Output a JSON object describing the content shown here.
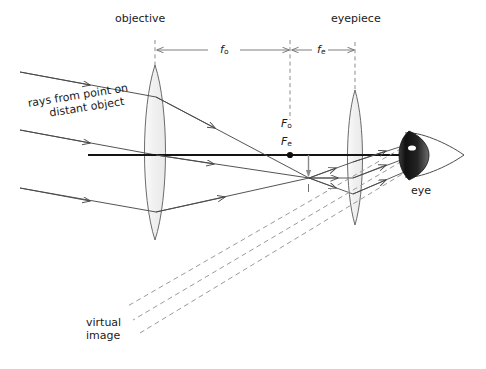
{
  "figure": {
    "background": "#ffffff",
    "ink": "#1a1a1a",
    "ray_color": "#4a4a4a",
    "dash_color": "#8c8c8c",
    "lens_fill": "#f2f2f2",
    "lens_stroke": "#6b6b6b",
    "eye_dark": "#1c1c1c"
  },
  "labels": {
    "objective": "objective",
    "eyepiece": "eyepiece",
    "eye": "eye",
    "rays_line1": "rays from point on",
    "rays_line2": "distant object",
    "virtual_line1": "virtual",
    "virtual_line2": "image",
    "focal_objective": "f",
    "focal_objective_sub": "o",
    "focal_eyepiece": "f",
    "focal_eyepiece_sub": "e",
    "point_objective": "F",
    "point_objective_sub": "o",
    "point_eyepiece": "F",
    "point_eyepiece_sub": "e"
  },
  "diagram_data": {
    "type": "optical-ray-diagram",
    "axis_y": 155,
    "objective": {
      "center_x": 155,
      "top_y": 65,
      "bottom_y": 240,
      "half_width": 14
    },
    "eyepiece": {
      "center_x": 355,
      "top_y": 90,
      "bottom_y": 225,
      "half_width": 10
    },
    "focal_point": {
      "x": 290,
      "y": 155
    },
    "real_image": {
      "x": 308,
      "top_y": 155,
      "bottom_y": 179
    },
    "eye": {
      "x": 425,
      "y": 155
    },
    "dimension_fo": {
      "from_x": 155,
      "to_x": 290,
      "y": 50
    },
    "dimension_fe": {
      "from_x": 292,
      "to_x": 355,
      "y": 50
    },
    "incoming_rays": [
      {
        "x1": 20,
        "y1": 72,
        "x2": 155,
        "y2": 97
      },
      {
        "x1": 20,
        "y1": 130,
        "x2": 155,
        "y2": 155
      },
      {
        "x1": 20,
        "y1": 188,
        "x2": 155,
        "y2": 212
      }
    ],
    "virtual_image_rays": 3
  }
}
